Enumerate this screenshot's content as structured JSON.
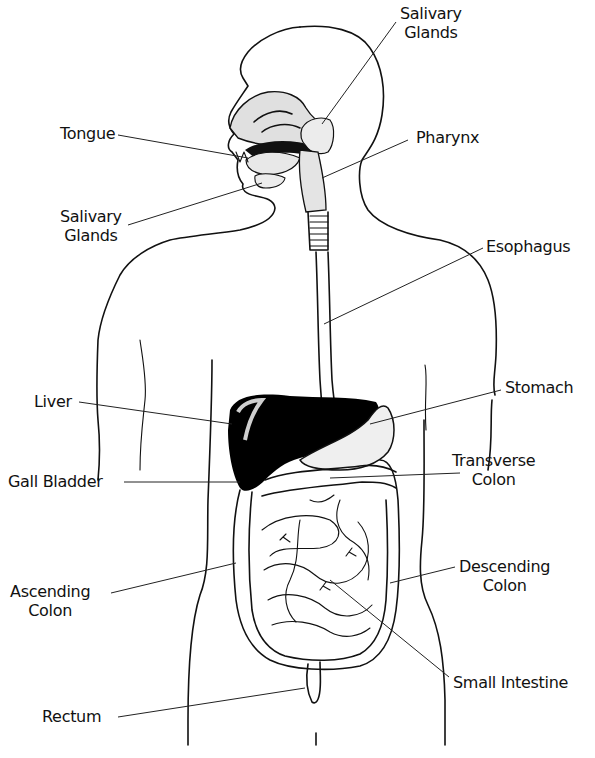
{
  "diagram": {
    "colors": {
      "ink": "#111111",
      "background": "#ffffff",
      "organ_dark": "#000000",
      "organ_shaded": "#d9d9d9"
    },
    "labels": {
      "salivary_glands_top": {
        "line1": "Salivary",
        "line2": "Glands"
      },
      "tongue": {
        "text": "Tongue"
      },
      "pharynx": {
        "text": "Pharynx"
      },
      "salivary_glands_left": {
        "line1": "Salivary",
        "line2": "Glands"
      },
      "esophagus": {
        "text": "Esophagus"
      },
      "liver": {
        "text": "Liver"
      },
      "stomach": {
        "text": "Stomach"
      },
      "transverse_colon": {
        "line1": "Transverse",
        "line2": "Colon"
      },
      "gall_bladder": {
        "text": "Gall Bladder"
      },
      "ascending_colon": {
        "line1": "Ascending",
        "line2": "Colon"
      },
      "descending_colon": {
        "line1": "Descending",
        "line2": "Colon"
      },
      "small_intestine": {
        "text": "Small Intestine"
      },
      "rectum": {
        "text": "Rectum"
      }
    }
  }
}
